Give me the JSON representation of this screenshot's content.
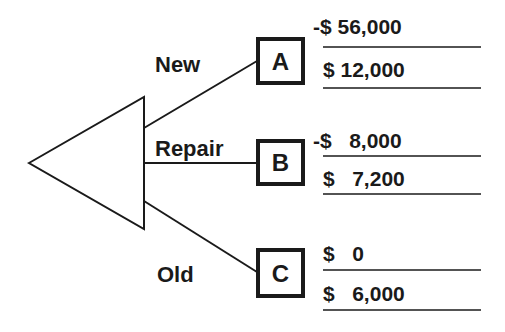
{
  "diagram": {
    "type": "decision-tree",
    "colors": {
      "ink": "#1a1a1a",
      "background": "#ffffff"
    },
    "decision_node": {
      "shape": "triangle",
      "icon": "decision-triangle-icon"
    },
    "branches": [
      {
        "label": "New",
        "node": "A",
        "values": [
          {
            "sign": "-",
            "currency": "$",
            "amount": "56,000",
            "text": "-$ 56,000"
          },
          {
            "sign": "",
            "currency": "$",
            "amount": "12,000",
            "text": "$ 12,000"
          }
        ]
      },
      {
        "label": "Repair",
        "node": "B",
        "values": [
          {
            "sign": "-",
            "currency": "$",
            "amount": "8,000",
            "text": "-$   8,000"
          },
          {
            "sign": "",
            "currency": "$",
            "amount": "7,200",
            "text": "$   7,200"
          }
        ]
      },
      {
        "label": "Old",
        "node": "C",
        "values": [
          {
            "sign": "",
            "currency": "$",
            "amount": "0",
            "text": "$   0"
          },
          {
            "sign": "",
            "currency": "$",
            "amount": "6,000",
            "text": "$   6,000"
          }
        ]
      }
    ]
  }
}
